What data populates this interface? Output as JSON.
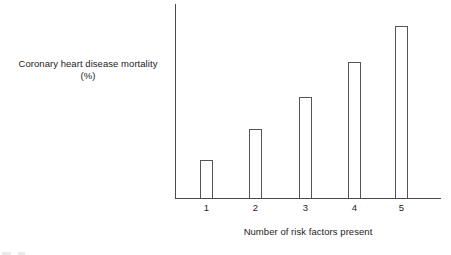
{
  "chart_data": {
    "type": "bar",
    "title": "",
    "subtitle": "",
    "xlabel": "Number of risk factors present",
    "ylabel": "Coronary heart disease mortality",
    "ylabel_line2": "(%)",
    "categories": [
      "1",
      "2",
      "3",
      "4",
      "5"
    ],
    "values": [
      22,
      40,
      59,
      79,
      100
    ],
    "value_unit": "relative % (largest bar = 100)",
    "ylim": [
      0,
      113
    ],
    "grid": false,
    "legend": null,
    "annotations": [],
    "axis_ticks_y": []
  },
  "figure": {
    "y_axis_caption_line1": "Coronary heart disease mortality",
    "y_axis_caption_line2": "(%)",
    "x_axis_title": "Number of risk factors present",
    "tick_labels": [
      "1",
      "2",
      "3",
      "4",
      "5"
    ],
    "colors": {
      "background": "#ffffff",
      "axis": "#4a4a4a",
      "bar_outline": "#555555",
      "bar_fill": "#ffffff",
      "text": "#1d1d1d"
    }
  }
}
